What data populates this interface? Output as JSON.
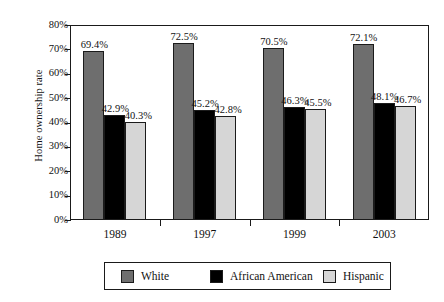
{
  "chart_data": {
    "type": "bar",
    "title": "",
    "xlabel": "",
    "ylabel": "Home ownership rate",
    "categories": [
      "1989",
      "1997",
      "1999",
      "2003"
    ],
    "ylim": [
      0,
      80
    ],
    "ytick_labels": [
      "0%",
      "10%",
      "20%",
      "30%",
      "40%",
      "50%",
      "60%",
      "70%",
      "80%"
    ],
    "ytick_values": [
      0,
      10,
      20,
      30,
      40,
      50,
      60,
      70,
      80
    ],
    "grid": false,
    "legend_position": "bottom",
    "value_suffix": "%",
    "series": [
      {
        "name": "White",
        "color": "#6e6e6e",
        "values": [
          69.4,
          72.5,
          70.5,
          72.1
        ],
        "labels": [
          "69.4%",
          "72.5%",
          "70.5%",
          "72.1%"
        ]
      },
      {
        "name": "African American",
        "color": "#000000",
        "values": [
          42.9,
          45.2,
          46.3,
          48.1
        ],
        "labels": [
          "42.9%",
          "45.2%",
          "46.3%",
          "48.1%"
        ]
      },
      {
        "name": "Hispanic",
        "color": "#d6d6d6",
        "values": [
          40.3,
          42.8,
          45.5,
          46.7
        ],
        "labels": [
          "40.3%",
          "42.8%",
          "45.5%",
          "46.7%"
        ]
      }
    ]
  }
}
